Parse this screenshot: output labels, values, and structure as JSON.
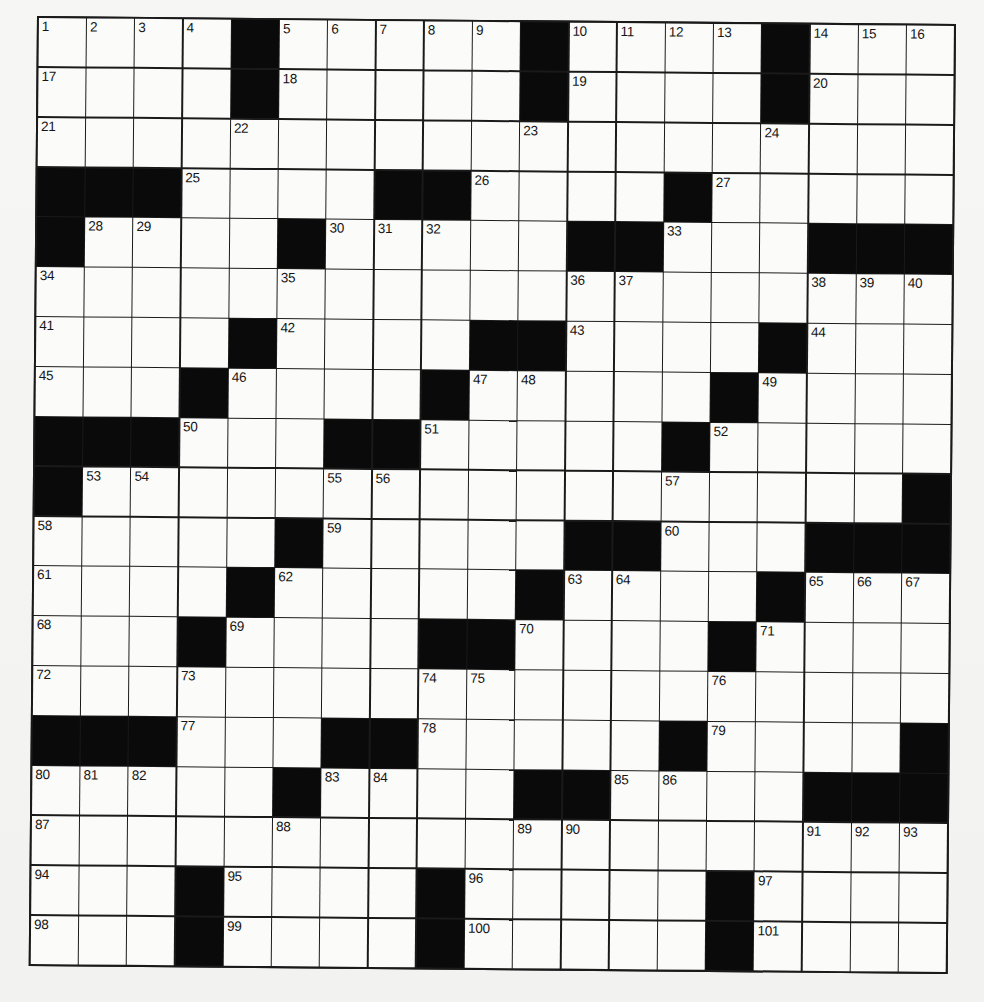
{
  "puzzle": {
    "type": "crossword",
    "rows": 19,
    "cols": 19,
    "colors": {
      "black_square": "#0a0a0a",
      "white_square": "#fbfbfa",
      "grid_line": "#1a1a1a",
      "background": "#f4f4f2"
    },
    "layout": [
      "....#.....#....#...",
      "....#.....#....#...",
      "...................",
      "###....##....#.....",
      "#....#.....##...###",
      "...................",
      "....#....##....#...",
      "...#....#.....#....",
      "###...##.....#.....",
      "#.................#",
      ".....#.....##...###",
      "....#.....#....#...",
      "...#....##....#....",
      "...................",
      "###...##.....#....#",
      ".....#....##....###",
      "...................",
      "...#....#.....#....",
      "...#....#.....#...."
    ],
    "numbers": {
      "0,0": "1",
      "0,1": "2",
      "0,2": "3",
      "0,3": "4",
      "0,5": "5",
      "0,6": "6",
      "0,7": "7",
      "0,8": "8",
      "0,9": "9",
      "0,11": "10",
      "0,12": "11",
      "0,13": "12",
      "0,14": "13",
      "0,16": "14",
      "0,17": "15",
      "0,18": "16",
      "1,0": "17",
      "1,5": "18",
      "1,11": "19",
      "1,16": "20",
      "2,0": "21",
      "2,4": "22",
      "2,10": "23",
      "2,15": "24",
      "3,3": "25",
      "3,9": "26",
      "3,14": "27",
      "4,1": "28",
      "4,2": "29",
      "4,6": "30",
      "4,7": "31",
      "4,8": "32",
      "4,13": "33",
      "5,0": "34",
      "5,5": "35",
      "5,11": "36",
      "5,12": "37",
      "5,16": "38",
      "5,17": "39",
      "5,18": "40",
      "6,0": "41",
      "6,5": "42",
      "6,11": "43",
      "6,16": "44",
      "7,0": "45",
      "7,4": "46",
      "7,9": "47",
      "7,10": "48",
      "7,15": "49",
      "8,3": "50",
      "8,8": "51",
      "8,14": "52",
      "9,1": "53",
      "9,2": "54",
      "9,6": "55",
      "9,7": "56",
      "9,13": "57",
      "10,0": "58",
      "10,6": "59",
      "10,13": "60",
      "11,0": "61",
      "11,5": "62",
      "11,11": "63",
      "11,12": "64",
      "11,16": "65",
      "11,17": "66",
      "11,18": "67",
      "12,0": "68",
      "12,4": "69",
      "12,10": "70",
      "12,15": "71",
      "13,0": "72",
      "13,3": "73",
      "13,8": "74",
      "13,9": "75",
      "13,14": "76",
      "14,3": "77",
      "14,8": "78",
      "14,14": "79",
      "15,0": "80",
      "15,1": "81",
      "15,2": "82",
      "15,6": "83",
      "15,7": "84",
      "15,12": "85",
      "15,13": "86",
      "16,0": "87",
      "16,5": "88",
      "16,10": "89",
      "16,11": "90",
      "16,16": "91",
      "16,17": "92",
      "16,18": "93",
      "17,0": "94",
      "17,4": "95",
      "17,9": "96",
      "17,15": "97",
      "18,0": "98",
      "18,4": "99",
      "18,9": "100",
      "18,15": "101"
    },
    "entries": {}
  }
}
